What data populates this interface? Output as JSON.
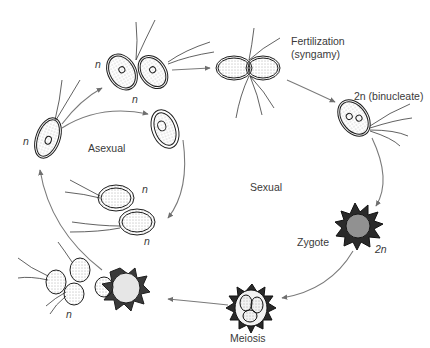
{
  "diagram": {
    "cycles": {
      "asexual": "Asexual",
      "sexual": "Sexual"
    },
    "labels": {
      "n_top_left_gamete": "n",
      "n_below_gametes": "n",
      "n_left_cell": "n",
      "n_daughter_top": "n",
      "n_daughter_bottom": "n",
      "n_released_cells": "n",
      "fertilization_line1": "Fertilization",
      "fertilization_line2": "(syngamy)",
      "binucleate": "2n (binucleate)",
      "zygote": "Zygote",
      "zygote_ploidy": "2n",
      "meiosis": "Meiosis"
    },
    "stages": [
      {
        "id": "vegetative-cell",
        "ploidy": "n"
      },
      {
        "id": "gametes",
        "ploidy": "n"
      },
      {
        "id": "fertilization",
        "label": "Fertilization (syngamy)"
      },
      {
        "id": "binucleate-cell",
        "ploidy": "2n"
      },
      {
        "id": "zygote",
        "ploidy": "2n"
      },
      {
        "id": "meiosis",
        "label": "Meiosis"
      },
      {
        "id": "released-haploid-cells",
        "ploidy": "n"
      },
      {
        "id": "dividing-cell",
        "cycle": "Asexual"
      },
      {
        "id": "daughter-cells",
        "ploidy": "n"
      }
    ],
    "colors": {
      "line": "#7a7a7a",
      "ink": "#1e1e1e",
      "text": "#3a3a3a"
    }
  }
}
